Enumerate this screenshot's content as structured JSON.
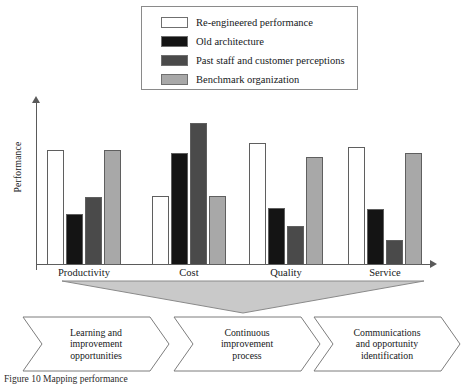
{
  "figure": {
    "caption": "Figure 10  Mapping performance"
  },
  "legend": {
    "position": "top-center",
    "items": [
      {
        "label": "Re-engineered performance",
        "color": "#ffffff",
        "swatch_name": "legend-swatch-re-engineered"
      },
      {
        "label": "Old architecture",
        "color": "#141414",
        "swatch_name": "legend-swatch-old-architecture"
      },
      {
        "label": "Past staff and customer perceptions",
        "color": "#4a4a4a",
        "swatch_name": "legend-swatch-perceptions"
      },
      {
        "label": "Benchmark organization",
        "color": "#a8a8a8",
        "swatch_name": "legend-swatch-benchmark"
      }
    ]
  },
  "chart_data": {
    "type": "bar",
    "title": "",
    "xlabel": "",
    "ylabel": "Performance",
    "grid": false,
    "legend_position": "top-center",
    "ylim": [
      0,
      100
    ],
    "categories": [
      "Productivity",
      "Cost",
      "Quality",
      "Service"
    ],
    "series": [
      {
        "name": "Re-engineered performance",
        "color": "#ffffff",
        "values": [
          68,
          41,
          72,
          70
        ]
      },
      {
        "name": "Old architecture",
        "color": "#141414",
        "values": [
          30,
          66,
          34,
          33
        ]
      },
      {
        "name": "Past staff and customer perceptions",
        "color": "#4a4a4a",
        "values": [
          40,
          84,
          23,
          15
        ]
      },
      {
        "name": "Benchmark organization",
        "color": "#a8a8a8",
        "values": [
          68,
          41,
          64,
          66
        ]
      }
    ]
  },
  "funnel": {
    "name": "funnel-triangle",
    "fill": "#c9c9c9",
    "stroke": "#8a8a8a"
  },
  "process_steps": [
    {
      "lines": [
        "Learning and",
        "improvement",
        "opportunities"
      ]
    },
    {
      "lines": [
        "Continuous",
        "improvement",
        "process"
      ]
    },
    {
      "lines": [
        "Communications",
        "and opportunity",
        "identification"
      ]
    }
  ]
}
